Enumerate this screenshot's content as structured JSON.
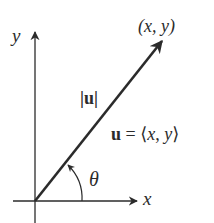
{
  "diagram": {
    "axes": {
      "x_label": "x",
      "y_label": "y"
    },
    "vector": {
      "tip_label": "(x, y)",
      "magnitude_label": "|u|",
      "definition_label": "u = ⟨x, y⟩",
      "angle_label": "θ"
    },
    "colors": {
      "stroke": "#2b2b2b",
      "background": "#ffffff"
    }
  }
}
